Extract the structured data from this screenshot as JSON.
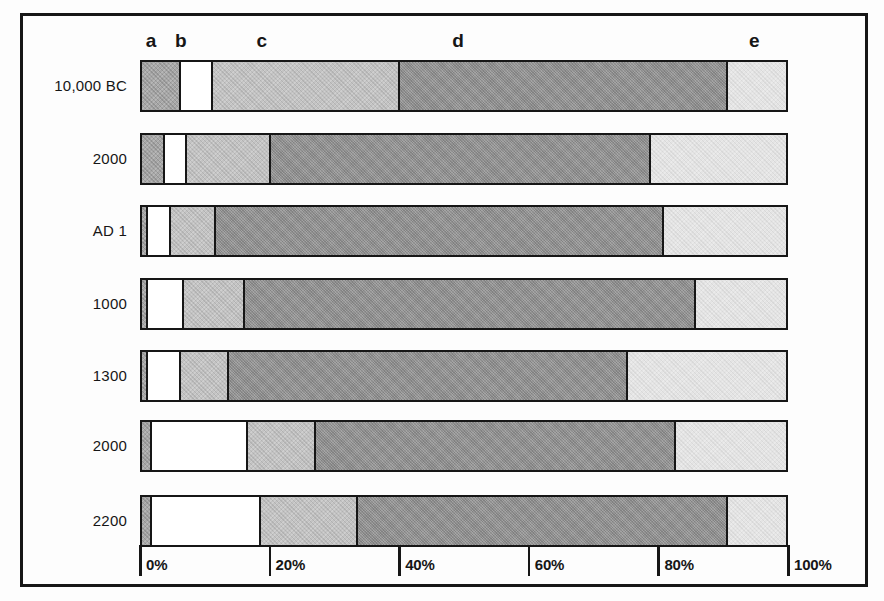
{
  "chart_data": {
    "type": "bar",
    "orientation": "horizontal",
    "stacked": true,
    "title": "",
    "xlabel": "",
    "ylabel": "",
    "xlim": [
      0,
      100
    ],
    "grid": false,
    "legend_position": "top-letters",
    "categories": [
      "10,000 BC",
      "2000",
      "AD 1",
      "1000",
      "1300",
      "2000",
      "2200"
    ],
    "segment_labels": [
      "a",
      "b",
      "c",
      "d",
      "e"
    ],
    "series": [
      {
        "name": "a",
        "values": [
          6,
          3.5,
          1,
          1,
          1,
          1.5,
          1.5
        ]
      },
      {
        "name": "b",
        "values": [
          5,
          3.5,
          3.5,
          5.5,
          5,
          15,
          17
        ]
      },
      {
        "name": "c",
        "values": [
          29,
          13,
          7,
          9.5,
          7.5,
          10.5,
          15
        ]
      },
      {
        "name": "d",
        "values": [
          51,
          59,
          69.5,
          70,
          62,
          56,
          57.5
        ]
      },
      {
        "name": "e",
        "values": [
          9,
          21,
          19,
          14,
          24.5,
          17,
          9
        ]
      }
    ],
    "x_ticks": [
      {
        "label": "0%",
        "value": 0
      },
      {
        "label": "20%",
        "value": 20
      },
      {
        "label": "40%",
        "value": 40
      },
      {
        "label": "60%",
        "value": 60
      },
      {
        "label": "80%",
        "value": 80
      },
      {
        "label": "100%",
        "value": 100
      }
    ],
    "segment_label_pos_pct": {
      "a": 1.7,
      "b": 6.3,
      "c": 18.8,
      "d": 49.1,
      "e": 94.8
    },
    "colors": {
      "a": "#a7a7a7",
      "b": "#ffffff",
      "c": "#c3c3c3",
      "d": "#989898",
      "e": "#e4e4e4",
      "border": "#161616"
    }
  }
}
